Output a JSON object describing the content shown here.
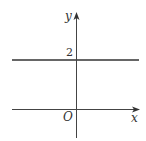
{
  "diagram": {
    "type": "coordinate-plane",
    "axes": {
      "x_label": "x",
      "y_label": "y",
      "origin_label": "O"
    },
    "lines": [
      {
        "equation": "y = 2",
        "intercept_label": "2"
      }
    ],
    "colors": {
      "line": "#333333",
      "axis": "#444444",
      "background": "#ffffff"
    }
  }
}
